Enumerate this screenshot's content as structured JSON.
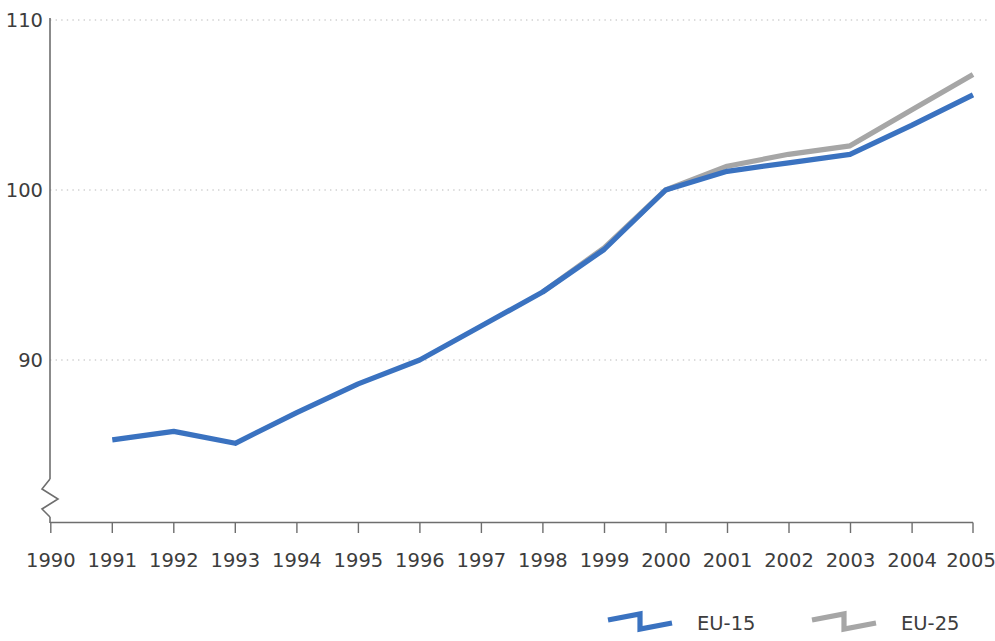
{
  "chart_data": {
    "type": "line",
    "title": "",
    "subtitle": "",
    "xlabel": "",
    "ylabel": "",
    "x": [
      1990,
      1991,
      1992,
      1993,
      1994,
      1995,
      1996,
      1997,
      1998,
      1999,
      2000,
      2001,
      2002,
      2003,
      2004,
      2005
    ],
    "categories": [
      "1990",
      "1991",
      "1992",
      "1993",
      "1994",
      "1995",
      "1996",
      "1997",
      "1998",
      "1999",
      "2000",
      "2001",
      "2002",
      "2003",
      "2004",
      "2005"
    ],
    "series": [
      {
        "name": "EU-15",
        "color": "#3a72c0",
        "values": [
          null,
          85.3,
          85.8,
          85.1,
          86.9,
          88.6,
          90.0,
          92.0,
          94.0,
          96.5,
          100.0,
          101.1,
          101.6,
          102.1,
          103.8,
          105.6
        ]
      },
      {
        "name": "EU-25",
        "color": "#a6a6a6",
        "values": [
          null,
          null,
          null,
          null,
          null,
          null,
          null,
          null,
          94.0,
          96.6,
          100.0,
          101.4,
          102.1,
          102.6,
          104.7,
          106.8
        ]
      }
    ],
    "ylim": [
      80.6,
      110
    ],
    "yticks": [
      90,
      100,
      110
    ],
    "ytick_labels": [
      "90",
      "100",
      "110"
    ],
    "xlim": [
      1990,
      2005
    ],
    "grid": true,
    "grid_axis": "y",
    "y_axis_break": true,
    "legend_position": "bottom-right",
    "legend_entries": [
      {
        "label": "EU-15",
        "color": "#3a72c0"
      },
      {
        "label": "EU-25",
        "color": "#a6a6a6"
      }
    ],
    "colors": {
      "eu15": "#3a72c0",
      "eu25": "#a6a6a6",
      "axis": "#6e6e6e",
      "gridline": "#b9b9b9",
      "text": "#3d3d3d",
      "background": "#ffffff"
    }
  }
}
